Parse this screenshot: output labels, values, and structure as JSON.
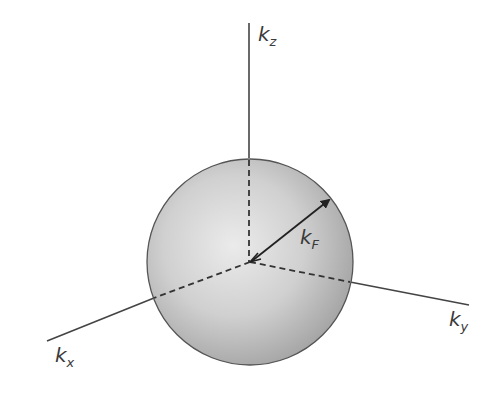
{
  "diagram": {
    "colors": {
      "line": "#444444",
      "sphere_light": "#e6e6e6",
      "sphere_mid": "#c8c8c8",
      "sphere_dark": "#9a9a9a",
      "sphere_edge": "#555555",
      "text": "#3a3a3a"
    },
    "axes": {
      "kz": {
        "base": "k",
        "sub": "z"
      },
      "kx": {
        "base": "k",
        "sub": "x"
      },
      "ky": {
        "base": "k",
        "sub": "y"
      }
    },
    "radius_vector": {
      "base": "k",
      "sub": "F"
    }
  }
}
